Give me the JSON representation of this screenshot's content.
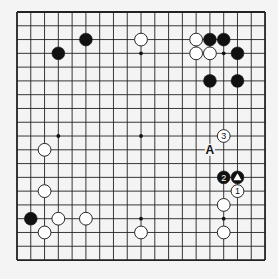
{
  "board": {
    "size": 19,
    "origin_x": 17,
    "origin_y": 12,
    "spacing": 13.78,
    "line_color": "#222222",
    "background": "#f4f4f4",
    "star_points": [
      [
        3,
        3
      ],
      [
        9,
        3
      ],
      [
        15,
        3
      ],
      [
        3,
        9
      ],
      [
        9,
        9
      ],
      [
        15,
        9
      ],
      [
        3,
        15
      ],
      [
        9,
        15
      ],
      [
        15,
        15
      ]
    ]
  },
  "stones": [
    {
      "color": "black",
      "col": 5,
      "row": 2
    },
    {
      "color": "black",
      "col": 3,
      "row": 3
    },
    {
      "color": "white",
      "col": 9,
      "row": 2
    },
    {
      "color": "white",
      "col": 13,
      "row": 2
    },
    {
      "color": "black",
      "col": 14,
      "row": 2
    },
    {
      "color": "black",
      "col": 15,
      "row": 2
    },
    {
      "color": "white",
      "col": 13,
      "row": 3
    },
    {
      "color": "white",
      "col": 14,
      "row": 3
    },
    {
      "color": "black",
      "col": 16,
      "row": 3
    },
    {
      "color": "black",
      "col": 14,
      "row": 5
    },
    {
      "color": "black",
      "col": 16,
      "row": 5
    },
    {
      "color": "white",
      "col": 15,
      "row": 9,
      "label": "3"
    },
    {
      "color": "black",
      "col": 15,
      "row": 12,
      "label": "2"
    },
    {
      "color": "black",
      "col": 16,
      "row": 12,
      "mark": "triangle"
    },
    {
      "color": "white",
      "col": 16,
      "row": 13,
      "label": "1"
    },
    {
      "color": "white",
      "col": 15,
      "row": 14
    },
    {
      "color": "white",
      "col": 15,
      "row": 16
    },
    {
      "color": "white",
      "col": 9,
      "row": 16
    },
    {
      "color": "white",
      "col": 2,
      "row": 10
    },
    {
      "color": "white",
      "col": 2,
      "row": 13
    },
    {
      "color": "black",
      "col": 1,
      "row": 15
    },
    {
      "color": "white",
      "col": 3,
      "row": 15
    },
    {
      "color": "white",
      "col": 5,
      "row": 15
    },
    {
      "color": "white",
      "col": 2,
      "row": 16
    }
  ],
  "letters": [
    {
      "text": "A",
      "col": 14,
      "row": 10
    }
  ]
}
